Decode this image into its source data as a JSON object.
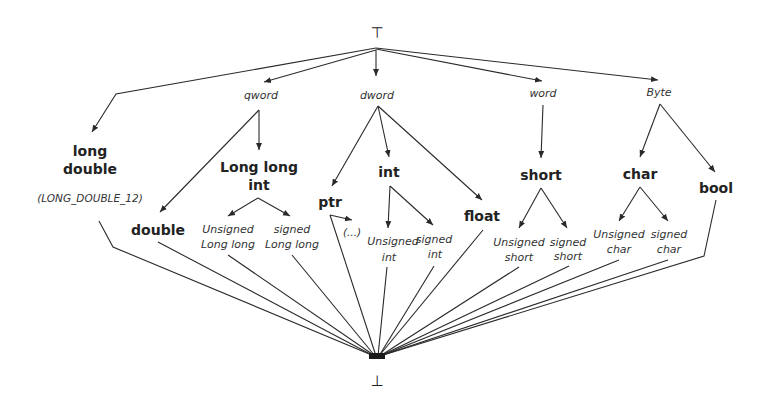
{
  "diagram": {
    "title": "",
    "top": {
      "symbol": "⊤",
      "name": "top"
    },
    "bottom": {
      "symbol": "⊥",
      "name": "bottom"
    },
    "size_classes": {
      "qword": "qword",
      "dword": "dword",
      "word": "word",
      "byte": "Byte"
    },
    "types": {
      "long_double": [
        "long",
        "double"
      ],
      "long_double_note": "(LONG_DOUBLE_12)",
      "long_long_int": [
        "Long long",
        "int"
      ],
      "double": "double",
      "ptr": "ptr",
      "ptr_target": "(...)",
      "int": "int",
      "float": "float",
      "short": "short",
      "char": "char",
      "bool": "bool"
    },
    "subtypes": {
      "unsigned_long_long": [
        "Unsigned",
        "Long long"
      ],
      "signed_long_long": [
        "signed",
        "Long long"
      ],
      "unsigned_int": [
        "Unsigned",
        "int"
      ],
      "signed_int": [
        "signed",
        "int"
      ],
      "unsigned_short": [
        "Unsigned",
        "short"
      ],
      "signed_short": [
        "signed",
        "short"
      ],
      "unsigned_char": [
        "Unsigned",
        "char"
      ],
      "signed_char": [
        "signed",
        "char"
      ]
    },
    "edges_from_top": [
      "long double",
      "qword",
      "dword",
      "word",
      "Byte"
    ],
    "edges": [
      [
        "qword",
        "Long long int"
      ],
      [
        "qword",
        "double"
      ],
      [
        "dword",
        "ptr"
      ],
      [
        "dword",
        "int"
      ],
      [
        "dword",
        "float"
      ],
      [
        "word",
        "short"
      ],
      [
        "Byte",
        "char"
      ],
      [
        "Byte",
        "bool"
      ],
      [
        "Long long int",
        "Unsigned Long long"
      ],
      [
        "Long long int",
        "signed Long long"
      ],
      [
        "int",
        "Unsigned int"
      ],
      [
        "int",
        "signed int"
      ],
      [
        "ptr",
        "(...)"
      ],
      [
        "short",
        "Unsigned short"
      ],
      [
        "short",
        "signed short"
      ],
      [
        "char",
        "Unsigned char"
      ],
      [
        "char",
        "signed char"
      ]
    ],
    "edges_to_bottom": [
      "long double",
      "double",
      "Unsigned Long long",
      "signed Long long",
      "ptr",
      "Unsigned int",
      "signed int",
      "float",
      "Unsigned short",
      "signed short",
      "Unsigned char",
      "signed char",
      "bool"
    ],
    "colors": {
      "line": "#2a2a2a",
      "text": "#222222",
      "background": "#ffffff"
    }
  }
}
